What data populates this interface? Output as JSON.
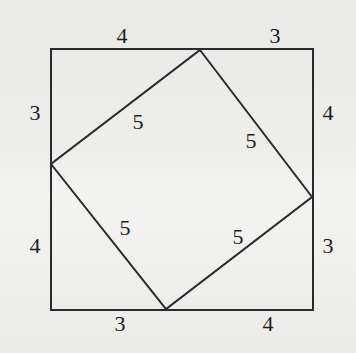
{
  "diagram": {
    "colors": {
      "line": "#2a2a2a",
      "text": "#1e1e1e",
      "background": "#ececea"
    },
    "outer_square": {
      "points": [
        [
          51,
          49
        ],
        [
          313,
          49
        ],
        [
          313,
          310
        ],
        [
          51,
          310
        ]
      ]
    },
    "inner_square": {
      "points": [
        [
          200,
          50
        ],
        [
          312,
          197
        ],
        [
          166,
          309
        ],
        [
          51,
          164
        ]
      ]
    },
    "labels": [
      {
        "id": "top-left-4",
        "text": "4",
        "x": 122,
        "y": 35
      },
      {
        "id": "top-right-3",
        "text": "3",
        "x": 275,
        "y": 35
      },
      {
        "id": "left-upper-3",
        "text": "3",
        "x": 35,
        "y": 112
      },
      {
        "id": "right-upper-4",
        "text": "4",
        "x": 328,
        "y": 112
      },
      {
        "id": "hyp-upper-left-5",
        "text": "5",
        "x": 138,
        "y": 121
      },
      {
        "id": "hyp-upper-right-5",
        "text": "5",
        "x": 251,
        "y": 140
      },
      {
        "id": "hyp-lower-left-5",
        "text": "5",
        "x": 125,
        "y": 227
      },
      {
        "id": "hyp-lower-right-5",
        "text": "5",
        "x": 238,
        "y": 236
      },
      {
        "id": "left-lower-4",
        "text": "4",
        "x": 35,
        "y": 245
      },
      {
        "id": "right-lower-3",
        "text": "3",
        "x": 328,
        "y": 245
      },
      {
        "id": "bottom-left-3",
        "text": "3",
        "x": 120,
        "y": 323
      },
      {
        "id": "bottom-right-4",
        "text": "4",
        "x": 268,
        "y": 323
      }
    ]
  }
}
